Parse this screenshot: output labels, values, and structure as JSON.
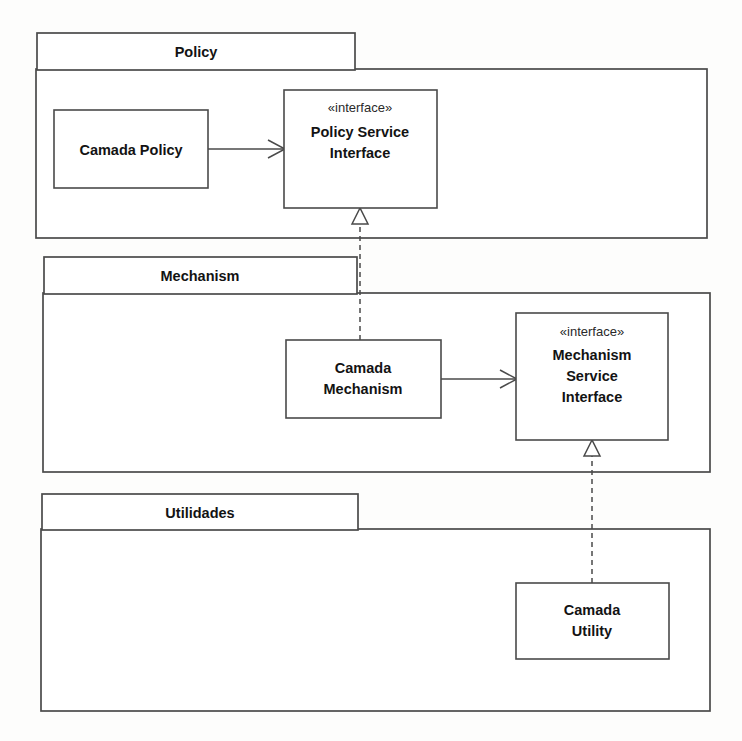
{
  "diagram": {
    "type": "uml-package-diagram",
    "background_color": "#fdfdfc",
    "stroke_color": "#4a4a4a",
    "text_color": "#131313"
  },
  "packages": [
    {
      "id": "policy",
      "name": "Policy",
      "tab": {
        "x": 37,
        "y": 33,
        "w": 318,
        "h": 37
      },
      "body": {
        "x": 36,
        "y": 69,
        "w": 671,
        "h": 169
      }
    },
    {
      "id": "mechanism",
      "name": "Mechanism",
      "tab": {
        "x": 44,
        "y": 257,
        "w": 313,
        "h": 37
      },
      "body": {
        "x": 43,
        "y": 293,
        "w": 667,
        "h": 179
      }
    },
    {
      "id": "utilidades",
      "name": "Utilidades",
      "tab": {
        "x": 42,
        "y": 494,
        "w": 316,
        "h": 36
      },
      "body": {
        "x": 41,
        "y": 529,
        "w": 669,
        "h": 182
      }
    }
  ],
  "classes": [
    {
      "id": "camada-policy",
      "stereotype": "",
      "lines": [
        "Camada Policy"
      ],
      "box": {
        "x": 54,
        "y": 110,
        "w": 154,
        "h": 78
      }
    },
    {
      "id": "policy-service-interface",
      "stereotype": "«interface»",
      "lines": [
        "Policy Service",
        "Interface"
      ],
      "box": {
        "x": 284,
        "y": 90,
        "w": 153,
        "h": 118
      }
    },
    {
      "id": "camada-mechanism",
      "stereotype": "",
      "lines": [
        "Camada",
        "Mechanism"
      ],
      "box": {
        "x": 286,
        "y": 340,
        "w": 155,
        "h": 78
      }
    },
    {
      "id": "mechanism-service-interface",
      "stereotype": "«interface»",
      "lines": [
        "Mechanism",
        "Service",
        "Interface"
      ],
      "box": {
        "x": 516,
        "y": 313,
        "w": 152,
        "h": 127
      }
    },
    {
      "id": "camada-utility",
      "stereotype": "",
      "lines": [
        "Camada",
        "Utility"
      ],
      "box": {
        "x": 516,
        "y": 583,
        "w": 153,
        "h": 76
      }
    }
  ],
  "connections": [
    {
      "id": "camada-policy-uses-policy-service",
      "kind": "association",
      "style": "solid",
      "head": "open-arrow",
      "from": "camada-policy",
      "to": "policy-service-interface"
    },
    {
      "id": "camada-mechanism-realizes-policy-service",
      "kind": "realization",
      "style": "dashed",
      "head": "hollow-triangle",
      "from": "camada-mechanism",
      "to": "policy-service-interface"
    },
    {
      "id": "camada-mechanism-uses-mechanism-service",
      "kind": "association",
      "style": "solid",
      "head": "open-arrow",
      "from": "camada-mechanism",
      "to": "mechanism-service-interface"
    },
    {
      "id": "camada-utility-realizes-mechanism-service",
      "kind": "realization",
      "style": "dashed",
      "head": "hollow-triangle",
      "from": "camada-utility",
      "to": "mechanism-service-interface"
    }
  ]
}
